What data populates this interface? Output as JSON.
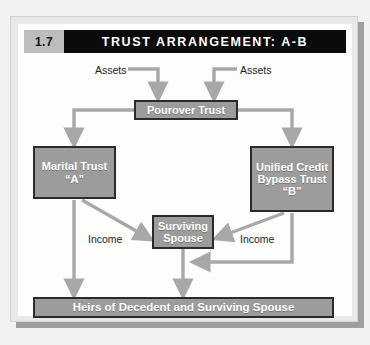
{
  "figure": {
    "number": "1.7",
    "title": "TRUST ARRANGEMENT: A-B"
  },
  "colors": {
    "header_bar": "#0b0b0b",
    "header_number_bg": "#bdbdbd",
    "node_fill": "#9c9c9c",
    "node_border": "#2b2b2b",
    "node_text": "#ffffff",
    "connector": "#a8a8a8",
    "page_bg": "#fdfdfc",
    "frame": "#e8e8e6"
  },
  "nodes": {
    "pourover": {
      "label": "Pourover Trust"
    },
    "marital": {
      "line1": "Marital Trust",
      "line2": "“A”"
    },
    "bypass": {
      "line1": "Unified Credit",
      "line2": "Bypass Trust",
      "line3": "“B”"
    },
    "spouse": {
      "line1": "Surviving",
      "line2": "Spouse"
    },
    "heirs": {
      "label": "Heirs of Decedent and Surviving Spouse"
    }
  },
  "labels": {
    "assets_left": "Assets",
    "assets_right": "Assets",
    "income_left": "Income",
    "income_right": "Income"
  },
  "flows": [
    {
      "from": "assets_left",
      "to": "pourover",
      "label": "Assets"
    },
    {
      "from": "assets_right",
      "to": "pourover",
      "label": "Assets"
    },
    {
      "from": "pourover",
      "to": "marital",
      "label": ""
    },
    {
      "from": "pourover",
      "to": "bypass",
      "label": ""
    },
    {
      "from": "marital",
      "to": "spouse",
      "label": "Income"
    },
    {
      "from": "bypass",
      "to": "spouse",
      "label": "Income"
    },
    {
      "from": "marital",
      "to": "heirs",
      "label": ""
    },
    {
      "from": "bypass",
      "to": "heirs",
      "label": ""
    },
    {
      "from": "spouse",
      "to": "heirs",
      "label": ""
    }
  ]
}
